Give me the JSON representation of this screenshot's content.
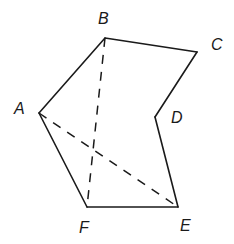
{
  "diagram": {
    "type": "geometry-figure",
    "vertices": [
      {
        "name": "A",
        "x": 39,
        "y": 113,
        "label_x": 14,
        "label_y": 114
      },
      {
        "name": "B",
        "x": 105,
        "y": 38,
        "label_x": 98,
        "label_y": 24
      },
      {
        "name": "C",
        "x": 197,
        "y": 52,
        "label_x": 211,
        "label_y": 50
      },
      {
        "name": "D",
        "x": 155,
        "y": 117,
        "label_x": 171,
        "label_y": 123
      },
      {
        "name": "E",
        "x": 178,
        "y": 207,
        "label_x": 180,
        "label_y": 231
      },
      {
        "name": "F",
        "x": 87,
        "y": 207,
        "label_x": 79,
        "label_y": 233
      }
    ],
    "solid_edges": [
      [
        "A",
        "B"
      ],
      [
        "B",
        "C"
      ],
      [
        "C",
        "D"
      ],
      [
        "D",
        "E"
      ],
      [
        "E",
        "F"
      ],
      [
        "F",
        "A"
      ]
    ],
    "dashed_edges": [
      [
        "B",
        "F"
      ],
      [
        "A",
        "E"
      ]
    ],
    "colors": {
      "stroke": "#1a1a1a",
      "background": "#ffffff"
    }
  }
}
